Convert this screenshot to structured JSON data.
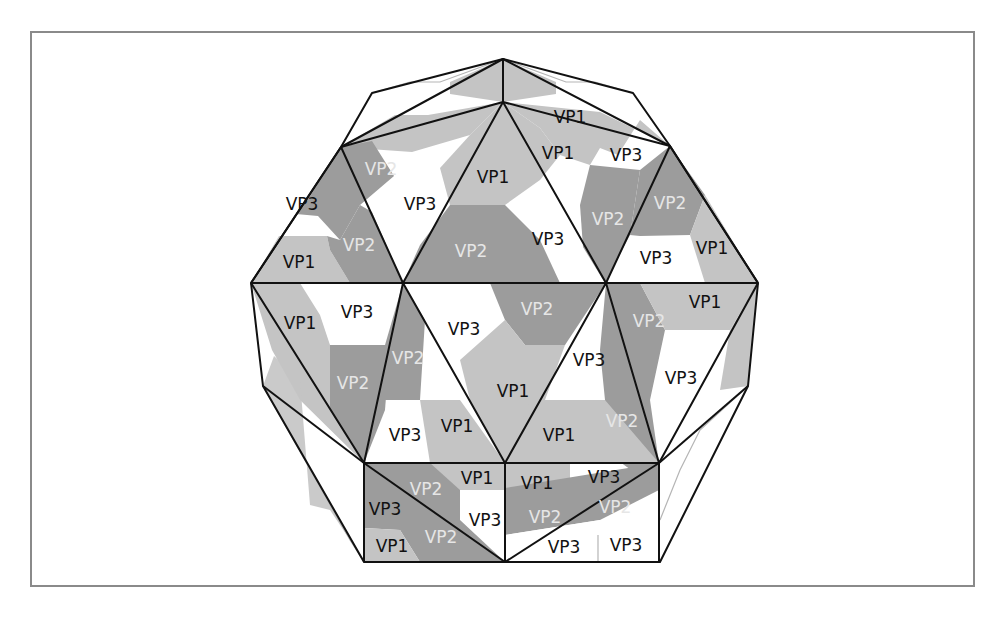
{
  "figure": {
    "type": "capsid-diagram",
    "colors": {
      "vp1": "#c4c4c4",
      "vp2": "#9c9c9c",
      "vp3": "#ffffff",
      "edge": "#111111",
      "frame": "#8a8a8a",
      "vp2_text": "#e6e6e6"
    },
    "labels": [
      {
        "text": "VP1",
        "x": 570,
        "y": 118,
        "c": "dark"
      },
      {
        "text": "VP2",
        "x": 381,
        "y": 170,
        "c": "light"
      },
      {
        "text": "VP1",
        "x": 493,
        "y": 178,
        "c": "dark"
      },
      {
        "text": "VP1",
        "x": 558,
        "y": 154,
        "c": "dark"
      },
      {
        "text": "VP3",
        "x": 626,
        "y": 156,
        "c": "dark"
      },
      {
        "text": "VP3",
        "x": 302,
        "y": 205,
        "c": "dark"
      },
      {
        "text": "VP3",
        "x": 420,
        "y": 205,
        "c": "dark"
      },
      {
        "text": "VP2",
        "x": 608,
        "y": 220,
        "c": "light"
      },
      {
        "text": "VP2",
        "x": 670,
        "y": 204,
        "c": "light"
      },
      {
        "text": "VP2",
        "x": 359,
        "y": 246,
        "c": "light"
      },
      {
        "text": "VP2",
        "x": 471,
        "y": 252,
        "c": "light"
      },
      {
        "text": "VP3",
        "x": 548,
        "y": 240,
        "c": "dark"
      },
      {
        "text": "VP1",
        "x": 299,
        "y": 263,
        "c": "dark"
      },
      {
        "text": "VP3",
        "x": 656,
        "y": 259,
        "c": "dark"
      },
      {
        "text": "VP1",
        "x": 712,
        "y": 249,
        "c": "dark"
      },
      {
        "text": "VP3",
        "x": 357,
        "y": 313,
        "c": "dark"
      },
      {
        "text": "VP2",
        "x": 537,
        "y": 310,
        "c": "light"
      },
      {
        "text": "VP1",
        "x": 705,
        "y": 303,
        "c": "dark"
      },
      {
        "text": "VP1",
        "x": 300,
        "y": 324,
        "c": "dark"
      },
      {
        "text": "VP3",
        "x": 464,
        "y": 330,
        "c": "dark"
      },
      {
        "text": "VP2",
        "x": 649,
        "y": 322,
        "c": "light"
      },
      {
        "text": "VP2",
        "x": 408,
        "y": 359,
        "c": "light"
      },
      {
        "text": "VP3",
        "x": 589,
        "y": 361,
        "c": "dark"
      },
      {
        "text": "VP2",
        "x": 353,
        "y": 384,
        "c": "light"
      },
      {
        "text": "VP1",
        "x": 513,
        "y": 392,
        "c": "dark"
      },
      {
        "text": "VP3",
        "x": 681,
        "y": 379,
        "c": "dark"
      },
      {
        "text": "VP3",
        "x": 405,
        "y": 436,
        "c": "dark"
      },
      {
        "text": "VP1",
        "x": 457,
        "y": 427,
        "c": "dark"
      },
      {
        "text": "VP1",
        "x": 559,
        "y": 436,
        "c": "dark"
      },
      {
        "text": "VP2",
        "x": 622,
        "y": 422,
        "c": "light"
      },
      {
        "text": "VP1",
        "x": 477,
        "y": 479,
        "c": "dark"
      },
      {
        "text": "VP1",
        "x": 537,
        "y": 484,
        "c": "dark"
      },
      {
        "text": "VP3",
        "x": 604,
        "y": 478,
        "c": "dark"
      },
      {
        "text": "VP2",
        "x": 426,
        "y": 490,
        "c": "light"
      },
      {
        "text": "VP3",
        "x": 385,
        "y": 510,
        "c": "dark"
      },
      {
        "text": "VP3",
        "x": 485,
        "y": 521,
        "c": "dark"
      },
      {
        "text": "VP2",
        "x": 545,
        "y": 518,
        "c": "light"
      },
      {
        "text": "VP2",
        "x": 615,
        "y": 508,
        "c": "light"
      },
      {
        "text": "VP1",
        "x": 392,
        "y": 547,
        "c": "dark"
      },
      {
        "text": "VP2",
        "x": 441,
        "y": 538,
        "c": "light"
      },
      {
        "text": "VP3",
        "x": 564,
        "y": 548,
        "c": "dark"
      },
      {
        "text": "VP3",
        "x": 626,
        "y": 546,
        "c": "dark"
      }
    ]
  }
}
